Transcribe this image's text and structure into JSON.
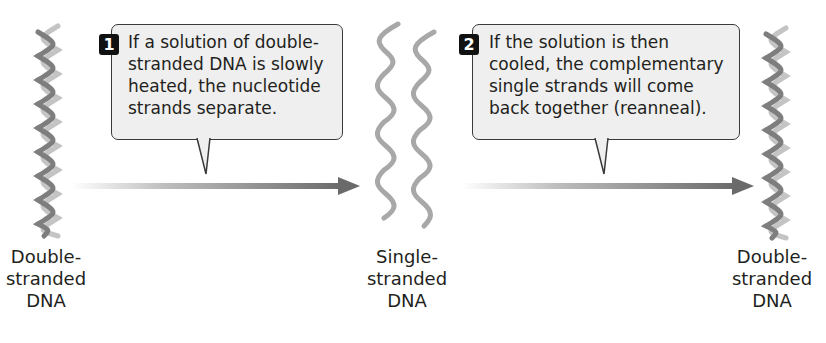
{
  "diagram": {
    "stages": [
      {
        "id": "start",
        "label_lines": [
          "Double-",
          "stranded",
          "DNA"
        ],
        "icon": "double-helix-icon"
      },
      {
        "id": "middle",
        "label_lines": [
          "Single-",
          "stranded",
          "DNA"
        ],
        "icon": "single-strands-icon"
      },
      {
        "id": "end",
        "label_lines": [
          "Double-",
          "stranded",
          "DNA"
        ],
        "icon": "double-helix-icon"
      }
    ],
    "steps": [
      {
        "number": "1",
        "lines": [
          "If a solution of double-",
          "stranded DNA is slowly",
          "heated, the nucleotide",
          "strands separate."
        ]
      },
      {
        "number": "2",
        "lines": [
          "If the solution is then",
          "cooled, the complementary",
          "single strands will come",
          "back together (reanneal)."
        ]
      }
    ],
    "colors": {
      "callout_bg": "#efefef",
      "callout_border": "#3a3a3a",
      "badge_bg": "#111111",
      "arrow": "#6e6e6e",
      "helix_light": "#bdbdbd",
      "helix_dark": "#7a7a7a",
      "text": "#231f20"
    }
  }
}
